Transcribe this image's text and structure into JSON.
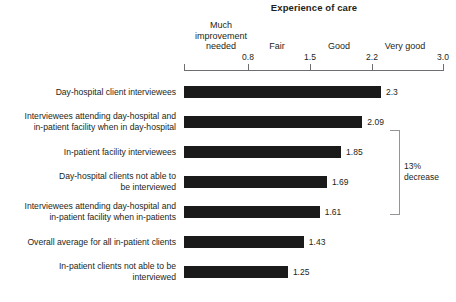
{
  "chart_data": {
    "type": "bar",
    "orientation": "horizontal",
    "title": "Experience of care",
    "xlabel": "",
    "ylabel": "",
    "xlim": [
      0.0,
      3.0
    ],
    "grid": false,
    "legend": null,
    "tick_labels": [
      "0.8",
      "1.5",
      "2.2",
      "3.0"
    ],
    "tick_values": [
      0.8,
      1.5,
      2.2,
      3.0
    ],
    "scale_bands": [
      {
        "label": "Much improvement needed",
        "display": "Much\nimprovement\nneeded"
      },
      {
        "label": "Fair",
        "display": "Fair"
      },
      {
        "label": "Good",
        "display": "Good"
      },
      {
        "label": "Very good",
        "display": "Very good"
      }
    ],
    "categories": [
      "Day-hospital client interviewees",
      "Interviewees attending day-hospital and in-patient facility when in day-hospital",
      "In-patient facility interviewees",
      "Day-hospital clients not able to be interviewed",
      "Interviewees attending day-hospital and in-patient facility when in-patients",
      "Overall average for all in-patient clients",
      "In-patient clients not able to be interviewed"
    ],
    "values": [
      2.3,
      2.09,
      1.85,
      1.69,
      1.61,
      1.43,
      1.25
    ],
    "value_labels": [
      "2.3",
      "2.09",
      "1.85",
      "1.69",
      "1.61",
      "1.43",
      "1.25"
    ],
    "annotations": [
      {
        "text": "13% decrease",
        "line1": "13%",
        "line2": "decrease",
        "spans_from": "Interviewees attending day-hospital and in-patient facility when in day-hospital",
        "spans_to": "Interviewees attending day-hospital and in-patient facility when in-patients"
      }
    ],
    "colors": {
      "bar": "#1a1a1a",
      "axis": "#6d6e71",
      "bracket": "#939598",
      "text": "#231f20",
      "background": "#ffffff"
    }
  },
  "rows": [
    {
      "label_line1": "Day-hospital client interviewees",
      "label_line2": "",
      "value": "2.3"
    },
    {
      "label_line1": "Interviewees attending day-hospital and",
      "label_line2": "in-patient facility when in day-hospital",
      "value": "2.09"
    },
    {
      "label_line1": "In-patient facility interviewees",
      "label_line2": "",
      "value": "1.85"
    },
    {
      "label_line1": "Day-hospital clients not able to",
      "label_line2": "be interviewed",
      "value": "1.69"
    },
    {
      "label_line1": "Interviewees attending day-hospital and",
      "label_line2": "in-patient facility when in-patients",
      "value": "1.61"
    },
    {
      "label_line1": "Overall average for all in-patient clients",
      "label_line2": "",
      "value": "1.43"
    },
    {
      "label_line1": "In-patient clients not able to be",
      "label_line2": "interviewed",
      "value": "1.25"
    }
  ],
  "axis": {
    "t0": "0.8",
    "t1": "1.5",
    "t2": "2.2",
    "t3": "3.0"
  },
  "bands": {
    "much": "Much improvement needed",
    "much_l1": "Much",
    "much_l2": "improvement",
    "much_l3": "needed",
    "fair": "Fair",
    "good": "Good",
    "very_good": "Very good"
  },
  "annotation": {
    "line1": "13%",
    "line2": "decrease"
  }
}
